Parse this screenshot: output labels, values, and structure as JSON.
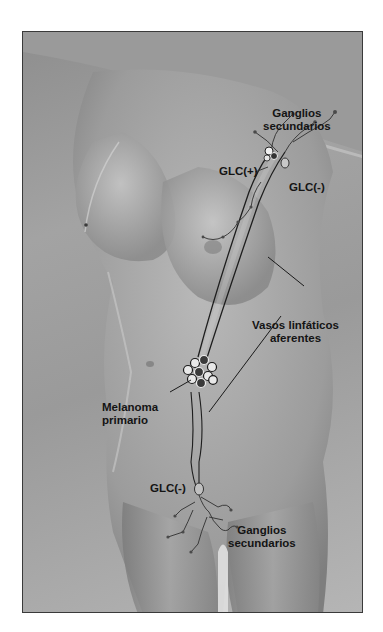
{
  "figure": {
    "colors": {
      "background": "#ffffff",
      "frame_border": "#3a3a3a",
      "skin_light": "#c8c8c8",
      "skin_dark": "#7a7a7a",
      "vessel": "#1e1e1e",
      "label_text": "#141414"
    }
  },
  "labels": {
    "ganglios_top_line1": "Ganglios",
    "ganglios_top_line2": "secundarios",
    "glc_positive": "GLC(+)",
    "glc_negative_axilla": "GLC(-)",
    "vasos_line1": "Vasos linfáticos",
    "vasos_line2": "aferentes",
    "melanoma_line1": "Melanoma",
    "melanoma_line2": "primario",
    "glc_negative_groin": "GLC(-)",
    "ganglios_bottom_line1": "Ganglios",
    "ganglios_bottom_line2": "secundarios"
  }
}
